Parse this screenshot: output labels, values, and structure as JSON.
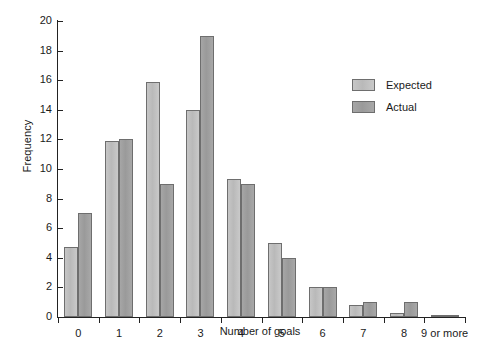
{
  "chart_data": {
    "type": "bar",
    "title": "",
    "xlabel": "Number of goals",
    "ylabel": "Frequency",
    "categories": [
      "0",
      "1",
      "2",
      "3",
      "4",
      "5",
      "6",
      "7",
      "8",
      "9 or more"
    ],
    "series": [
      {
        "name": "Expected",
        "color": "#bdbdbd",
        "values": [
          4.7,
          11.9,
          15.9,
          14.0,
          9.3,
          5.0,
          2.0,
          0.8,
          0.3,
          0.1
        ]
      },
      {
        "name": "Actual",
        "color": "#9d9d9d",
        "values": [
          7.0,
          12.0,
          9.0,
          19.0,
          9.0,
          4.0,
          2.0,
          1.0,
          1.0,
          0.15
        ]
      }
    ],
    "ylim": [
      0,
      20
    ],
    "ytick_values": [
      0,
      2,
      4,
      6,
      8,
      10,
      12,
      14,
      16,
      18,
      20
    ],
    "ytick_labels": [
      "0",
      "2",
      "4",
      "6",
      "8",
      "10",
      "12",
      "14",
      "16",
      "18",
      "20"
    ],
    "grid": false,
    "legend_position": "upper right",
    "legend": [
      "Expected",
      "Actual"
    ]
  }
}
